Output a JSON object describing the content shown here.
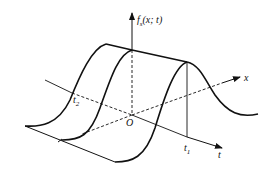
{
  "figure": {
    "labels": {
      "vertical_axis": "f",
      "vertical_axis_sub": "s",
      "vertical_axis_args": "(x; t)",
      "x_axis": "x",
      "t_axis": "t",
      "origin": "O",
      "t1": "t",
      "t1_sub": "1",
      "t2": "t",
      "t2_sub": "2"
    },
    "colors": {
      "stroke": "#111111",
      "background": "#ffffff"
    }
  }
}
